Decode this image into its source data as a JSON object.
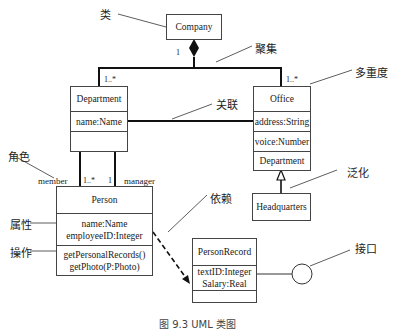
{
  "classes": {
    "company": {
      "name": "Company"
    },
    "department": {
      "name": "Department",
      "attributes": [
        "name:Name"
      ],
      "operations": []
    },
    "office": {
      "name": "Office",
      "attributes": [
        "address:String",
        "voice:Number"
      ],
      "extra": "Department"
    },
    "headquarters": {
      "name": "Headquarters"
    },
    "person": {
      "name": "Person",
      "attributes": [
        "name:Name",
        "employeeID:Integer"
      ],
      "operations": [
        "getPersonalRecords()",
        "getPhoto(P:Photo)"
      ]
    },
    "person_record": {
      "name": "PersonRecord",
      "attributes": [
        "textID:Integer",
        "Salary:Real"
      ]
    }
  },
  "multiplicities": {
    "company_end": "1",
    "department_end": "1..*",
    "office_end": "1..*",
    "member_end": "1..*",
    "manager_end": "1"
  },
  "roles": {
    "member": "member",
    "manager": "manager"
  },
  "annotations": {
    "class": "类",
    "aggregation": "聚集",
    "multiplicity": "多重度",
    "association": "关联",
    "role": "角色",
    "generalization": "泛化",
    "dependency": "依赖",
    "attribute": "属性",
    "operation": "操作",
    "interface": "接口"
  },
  "caption": "图 9.3  UML 类图"
}
